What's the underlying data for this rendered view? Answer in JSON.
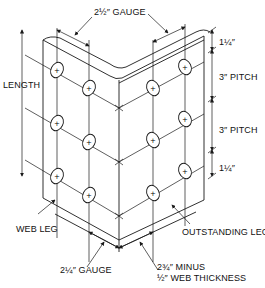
{
  "diagram": {
    "type": "angle-iron-rivet-layout",
    "labels": {
      "top_gauge": "2½″ GAUGE",
      "length": "LENGTH",
      "end_top": "1¼″",
      "pitch_1": "3″ PITCH",
      "pitch_2": "3″ PITCH",
      "end_bottom": "1¼″",
      "web_leg": "WEB LEG",
      "outstanding_leg": "OUTSTANDING LEG",
      "bottom_gauge": "2¼″ GAUGE",
      "bottom_right_line1": "2¾″ MINUS",
      "bottom_right_line2": "½″ WEB THICKNESS"
    },
    "rivets": {
      "web_leg_outer_column": 3,
      "web_leg_inner_column": 3,
      "outstanding_leg_inner_column": 3,
      "outstanding_leg_outer_column": 3
    }
  }
}
